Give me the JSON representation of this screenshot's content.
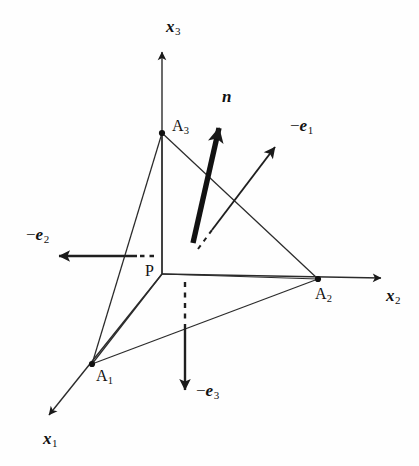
{
  "figure": {
    "kind": "3d-vector-diagram",
    "caption_present": false,
    "background_color": "#fefefe",
    "ink_color": "#1a1a1a",
    "width": 419,
    "height": 466
  },
  "labels": {
    "axis_x1": "x",
    "axis_x1_sub": "1",
    "axis_x2": "x",
    "axis_x2_sub": "2",
    "axis_x3": "x",
    "axis_x3_sub": "3",
    "vertex_a1": "A",
    "vertex_a1_sub": "1",
    "vertex_a2": "A",
    "vertex_a2_sub": "2",
    "vertex_a3": "A",
    "vertex_a3_sub": "3",
    "origin_p": "P",
    "normal_n": "n",
    "basis_e1_minus": "−",
    "basis_e1": "e",
    "basis_e1_sub": "1",
    "basis_e2_minus": "−",
    "basis_e2": "e",
    "basis_e2_sub": "2",
    "basis_e3_minus": "−",
    "basis_e3": "e",
    "basis_e3_sub": "3"
  },
  "geometry": {
    "origin": {
      "x": 162,
      "y": 274
    },
    "vertices": {
      "A1": {
        "x": 92,
        "y": 364
      },
      "A2": {
        "x": 318,
        "y": 279
      },
      "A3": {
        "x": 162,
        "y": 133
      }
    },
    "axis_tips": {
      "x1": {
        "x": 42,
        "y": 422
      },
      "x2": {
        "x": 389,
        "y": 278
      },
      "x3": {
        "x": 162,
        "y": 45
      }
    },
    "normal_vector": {
      "tail_x": 193,
      "tail_y": 243,
      "tip_x": 222,
      "tip_y": 116
    },
    "basis_vectors": {
      "minus_e1": {
        "tail_x": 210,
        "tail_y": 232,
        "tip_x": 282,
        "tip_y": 139,
        "dashed_tail_x": 198,
        "dashed_tail_y": 248
      },
      "minus_e2": {
        "tail_x": 136,
        "tail_y": 256,
        "tip_x": 51,
        "tip_y": 256,
        "dashed_tail_x": 153,
        "dashed_tail_y": 256
      },
      "minus_e3": {
        "tail_x": 185,
        "tail_y": 325,
        "tip_x": 185,
        "tip_y": 399,
        "dashed_tail_x": 185,
        "dashed_tail_y": 282
      }
    }
  },
  "label_positions": {
    "axis_x3": {
      "left": 166,
      "top": 18
    },
    "axis_x2": {
      "left": 386,
      "top": 287
    },
    "axis_x1": {
      "left": 43,
      "top": 430
    },
    "vertex_a3": {
      "left": 172,
      "top": 118
    },
    "vertex_a2": {
      "left": 315,
      "top": 286
    },
    "vertex_a1": {
      "left": 96,
      "top": 368
    },
    "origin_p": {
      "left": 145,
      "top": 263
    },
    "normal_n": {
      "left": 222,
      "top": 88
    },
    "basis_e1": {
      "left": 290,
      "top": 117
    },
    "basis_e2": {
      "left": 26,
      "top": 226
    },
    "basis_e3": {
      "left": 196,
      "top": 382
    }
  }
}
